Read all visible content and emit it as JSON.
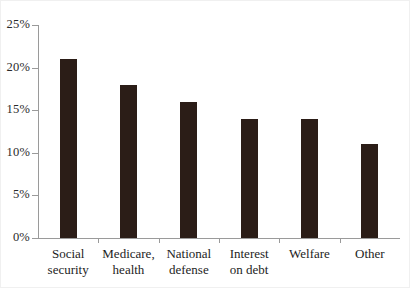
{
  "chart_data": {
    "type": "bar",
    "title": "",
    "subtitle": "",
    "xlabel": "",
    "ylabel": "",
    "categories": [
      "Social\nsecurity",
      "Medicare,\nhealth",
      "National\ndefense",
      "Interest\non debt",
      "Welfare",
      "Other"
    ],
    "values": [
      21,
      18,
      16,
      14,
      14,
      11
    ],
    "ylim": [
      0,
      25
    ],
    "ytick_values": [
      0,
      5,
      10,
      15,
      20,
      25
    ],
    "ytick_labels": [
      "0%",
      "5%",
      "10%",
      "15%",
      "20%",
      "25%"
    ],
    "grid": false,
    "legend": null,
    "legend_position": "none",
    "annotations": [],
    "series": [
      {
        "name": "Share of federal spending",
        "values": [
          21,
          18,
          16,
          14,
          14,
          11
        ]
      }
    ],
    "colors": {
      "bar": "#2b1d17",
      "axis": "#9a9a9a",
      "text": "#1d1d1d",
      "background": "#ffffff"
    }
  }
}
